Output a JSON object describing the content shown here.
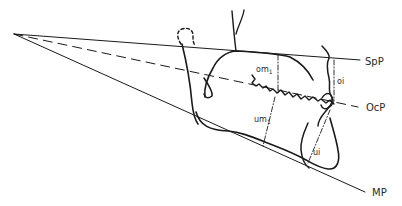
{
  "diagram": {
    "title": "",
    "colors": {
      "background": "#ffffff",
      "ink": "#1a1a1a",
      "label": "#2a2a2a"
    },
    "planes": [
      {
        "id": "spp",
        "label": "SpP",
        "style": "solid"
      },
      {
        "id": "ocp",
        "label": "OcP",
        "style": "dashed"
      },
      {
        "id": "mp",
        "label": "MP",
        "style": "solid"
      }
    ],
    "measurements": [
      {
        "id": "om1",
        "base": "om",
        "sub": "1",
        "style": "dash-dot"
      },
      {
        "id": "oi",
        "base": "oi",
        "sub": "",
        "style": "dash-dot"
      },
      {
        "id": "um1",
        "base": "um",
        "sub": "1",
        "style": "dash-dot"
      },
      {
        "id": "ui",
        "base": "ui",
        "sub": "",
        "style": "dash-dot"
      }
    ]
  }
}
